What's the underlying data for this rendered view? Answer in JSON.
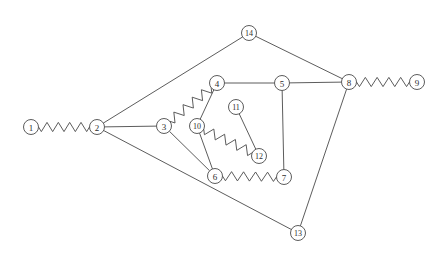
{
  "diagram": {
    "canvas": {
      "width": 445,
      "height": 256,
      "background": "#ffffff"
    },
    "style": {
      "node_radius": 7.5,
      "node_fill": "#ffffff",
      "node_stroke": "#4a4a4a",
      "edge_stroke": "#4a4a4a",
      "edge_width": 0.9,
      "zigzag_amplitude": 4.6,
      "zigzag_period": 6.0,
      "label_color": "#2e2e2e"
    },
    "nodes": [
      {
        "id": "1",
        "label": "1",
        "x": 31,
        "y": 127
      },
      {
        "id": "2",
        "label": "2",
        "x": 97,
        "y": 127
      },
      {
        "id": "3",
        "label": "3",
        "x": 164,
        "y": 126
      },
      {
        "id": "4",
        "label": "4",
        "x": 217,
        "y": 83
      },
      {
        "id": "5",
        "label": "5",
        "x": 282,
        "y": 83
      },
      {
        "id": "6",
        "label": "6",
        "x": 215,
        "y": 176
      },
      {
        "id": "7",
        "label": "7",
        "x": 284,
        "y": 177
      },
      {
        "id": "8",
        "label": "8",
        "x": 349,
        "y": 82
      },
      {
        "id": "9",
        "label": "9",
        "x": 417,
        "y": 82
      },
      {
        "id": "10",
        "label": "10",
        "x": 197,
        "y": 126
      },
      {
        "id": "11",
        "label": "11",
        "x": 236,
        "y": 107
      },
      {
        "id": "12",
        "label": "12",
        "x": 259,
        "y": 156
      },
      {
        "id": "13",
        "label": "13",
        "x": 298,
        "y": 233
      },
      {
        "id": "14",
        "label": "14",
        "x": 249,
        "y": 33
      }
    ],
    "edges": [
      {
        "from": "1",
        "to": "2",
        "style": "zigzag"
      },
      {
        "from": "2",
        "to": "14",
        "style": "straight"
      },
      {
        "from": "2",
        "to": "3",
        "style": "straight"
      },
      {
        "from": "2",
        "to": "13",
        "style": "straight"
      },
      {
        "from": "3",
        "to": "4",
        "style": "zigzag"
      },
      {
        "from": "3",
        "to": "6",
        "style": "straight"
      },
      {
        "from": "4",
        "to": "5",
        "style": "straight"
      },
      {
        "from": "4",
        "to": "10",
        "style": "straight"
      },
      {
        "from": "5",
        "to": "8",
        "style": "straight"
      },
      {
        "from": "5",
        "to": "7",
        "style": "straight"
      },
      {
        "from": "6",
        "to": "7",
        "style": "zigzag"
      },
      {
        "from": "8",
        "to": "9",
        "style": "zigzag"
      },
      {
        "from": "8",
        "to": "13",
        "style": "straight"
      },
      {
        "from": "8",
        "to": "14",
        "style": "straight"
      },
      {
        "from": "10",
        "to": "6",
        "style": "straight"
      },
      {
        "from": "10",
        "to": "12",
        "style": "zigzag"
      },
      {
        "from": "11",
        "to": "12",
        "style": "straight"
      }
    ]
  }
}
